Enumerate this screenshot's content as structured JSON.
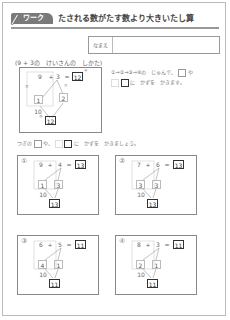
{
  "header": {
    "badge": "ワーク",
    "title": "たされる数がたす数より大きいたし算",
    "name_label": "なまえ"
  },
  "example": {
    "heading": "(9 + 3の　けいさんの　しかた)",
    "a": "9",
    "op": "+",
    "b": "3",
    "eq": "=",
    "answer": "12",
    "split_a": "1",
    "split_b": "2",
    "ten": "10",
    "result": "12",
    "markers": [
      "①",
      "②",
      "③",
      "④"
    ],
    "instruction_1": "①→②→③→④の　じゅんで、",
    "instruction_2": "や",
    "instruction_3": "に　かずを　かきます。"
  },
  "prompt": {
    "text_1": "つぎの",
    "text_2": "や、",
    "text_3": "に　かずを　かきましょう。"
  },
  "problems": [
    {
      "label": "①",
      "a": "9",
      "b": "4",
      "answer": "13",
      "split_a": "1",
      "split_b": "3",
      "ten": "10",
      "result": "13"
    },
    {
      "label": "②",
      "a": "7",
      "b": "6",
      "answer": "13",
      "split_a": "3",
      "split_b": "3",
      "ten": "10",
      "result": "13"
    },
    {
      "label": "③",
      "a": "6",
      "b": "5",
      "answer": "11",
      "split_a": "4",
      "split_b": "1",
      "ten": "10",
      "result": "11"
    },
    {
      "label": "④",
      "a": "8",
      "b": "3",
      "answer": "11",
      "split_a": "2",
      "split_b": "1",
      "ten": "10",
      "result": "11"
    }
  ],
  "symbols": {
    "op": "+",
    "eq": "="
  }
}
